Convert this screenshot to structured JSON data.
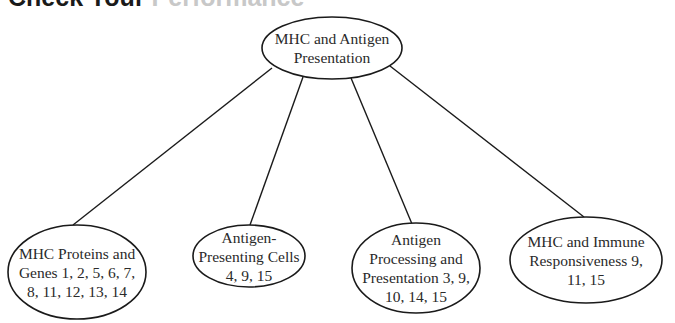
{
  "heading": {
    "dark": "Check Your",
    "light": "Performance"
  },
  "diagram": {
    "stroke_color": "#1a1a1a",
    "root": {
      "label": "MHC and Antigen Presentation",
      "cx": 332,
      "cy": 48,
      "rx": 70,
      "ry": 31,
      "text_width": 130
    },
    "children": [
      {
        "label": "MHC Proteins and Genes 1, 2, 5, 6, 7, 8, 11, 12, 13, 14",
        "cx": 77,
        "cy": 272,
        "rx": 69,
        "ry": 47,
        "text_width": 118,
        "line_from": [
          272,
          68
        ],
        "line_to": [
          73,
          225
        ]
      },
      {
        "label": "Antigen-Presenting Cells 4, 9, 15",
        "cx": 249,
        "cy": 256,
        "rx": 56,
        "ry": 31,
        "text_width": 106,
        "line_from": [
          303,
          77
        ],
        "line_to": [
          250,
          225
        ]
      },
      {
        "label": "Antigen Processing and Presentation 3, 9, 10, 14, 15",
        "cx": 416,
        "cy": 268,
        "rx": 64,
        "ry": 45,
        "text_width": 118,
        "line_from": [
          351,
          78
        ],
        "line_to": [
          412,
          224
        ]
      },
      {
        "label": "MHC and Immune Responsiveness 9, 11, 15",
        "cx": 586,
        "cy": 260,
        "rx": 76,
        "ry": 43,
        "text_width": 126,
        "line_from": [
          390,
          66
        ],
        "line_to": [
          584,
          217
        ]
      }
    ]
  }
}
